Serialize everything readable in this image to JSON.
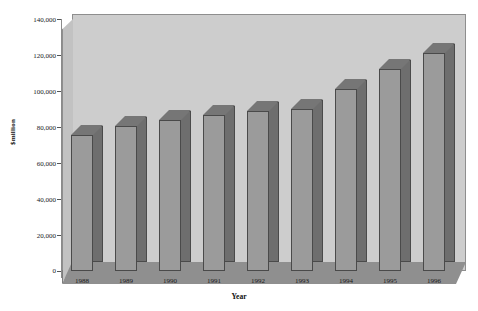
{
  "chart_data": {
    "type": "bar",
    "title": "",
    "subtitle": "",
    "xlabel": "Year",
    "ylabel": "$million",
    "categories": [
      "1988",
      "1989",
      "1990",
      "1991",
      "1992",
      "1993",
      "1994",
      "1995",
      "1996"
    ],
    "values": [
      74000,
      79000,
      82000,
      85000,
      87000,
      88000,
      99000,
      110000,
      119000
    ],
    "ytick_labels": [
      "140,000",
      "120,000",
      "100,000",
      "80,000",
      "60,000",
      "40,000",
      "20,000",
      "0"
    ],
    "ytick_values": [
      140000,
      120000,
      100000,
      80000,
      60000,
      40000,
      20000,
      0
    ],
    "ylim": [
      0,
      140000
    ],
    "ytick_interval": 20000,
    "grid": false,
    "legend": false,
    "legend_position": "none",
    "style": "3d-column",
    "series": [
      {
        "name": "",
        "values": [
          74000,
          79000,
          82000,
          85000,
          87000,
          88000,
          99000,
          110000,
          119000
        ]
      }
    ],
    "colors": {
      "bar_front": "#9b9b9b",
      "bar_side": "#6e6e6e",
      "bar_top": "#767676",
      "bar_outline": "#4a4a4a",
      "back_wall": "#cdcdcd",
      "left_wall": "#c2c2c2",
      "floor": "#8f8f8f",
      "frame": "#8e8e8e",
      "text": "#1a1a1a",
      "background": "#ffffff"
    }
  }
}
